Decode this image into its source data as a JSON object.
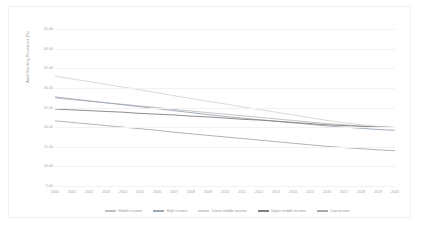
{
  "chart_data": {
    "type": "line",
    "title": "",
    "xlabel": "",
    "ylabel": "Adult Smoking Prevalence (%)",
    "ylim": [
      5,
      45
    ],
    "ytick_step": 5,
    "grid": true,
    "legend_position": "bottom",
    "x": [
      2000,
      2001,
      2002,
      2003,
      2004,
      2005,
      2006,
      2007,
      2008,
      2009,
      2010,
      2011,
      2012,
      2013,
      2014,
      2015,
      2016,
      2017,
      2018,
      2019,
      2020
    ],
    "xticklabels": [
      "2000",
      "2001",
      "2002",
      "2003",
      "2004",
      "2005",
      "2006",
      "2007",
      "2008",
      "2009",
      "2010",
      "2011",
      "2012",
      "2013",
      "2014",
      "2015",
      "2016",
      "2017",
      "2018",
      "2019",
      "2020"
    ],
    "yticklabels": [
      "5.00",
      "10.00",
      "15.00",
      "20.00",
      "25.00",
      "30.00",
      "35.00",
      "40.00",
      "45.00"
    ],
    "series": [
      {
        "name": "Middle income",
        "color": "#bfbfbf",
        "values": [
          27.4,
          27.0,
          26.6,
          26.2,
          25.8,
          25.4,
          25.0,
          24.5,
          24.1,
          23.7,
          23.3,
          22.9,
          22.5,
          22.1,
          21.7,
          21.3,
          20.9,
          20.6,
          20.3,
          20.1,
          19.9
        ]
      },
      {
        "name": "High income",
        "color": "#9aa7b4",
        "values": [
          27.7,
          27.2,
          26.7,
          26.2,
          25.7,
          25.2,
          24.7,
          24.2,
          23.7,
          23.2,
          22.7,
          22.3,
          21.9,
          21.5,
          21.1,
          20.7,
          20.3,
          20.0,
          19.7,
          19.4,
          19.2
        ]
      },
      {
        "name": "Lower middle income",
        "color": "#d6d6d6",
        "values": [
          33.0,
          32.3,
          31.6,
          30.9,
          30.2,
          29.5,
          28.8,
          28.0,
          27.3,
          26.6,
          25.9,
          25.2,
          24.5,
          23.8,
          23.1,
          22.4,
          21.7,
          21.1,
          20.6,
          20.2,
          19.9
        ]
      },
      {
        "name": "Upper middle income",
        "color": "#808080",
        "values": [
          24.6,
          24.4,
          24.2,
          24.0,
          23.8,
          23.5,
          23.3,
          23.1,
          22.8,
          22.6,
          22.3,
          22.0,
          21.8,
          21.5,
          21.2,
          20.9,
          20.6,
          20.4,
          20.2,
          20.0,
          19.9
        ]
      },
      {
        "name": "Low income",
        "color": "#a9a9a9",
        "values": [
          21.6,
          21.2,
          20.8,
          20.4,
          20.0,
          19.6,
          19.2,
          18.7,
          18.3,
          17.9,
          17.5,
          17.1,
          16.7,
          16.3,
          15.9,
          15.5,
          15.1,
          14.8,
          14.5,
          14.2,
          14.0
        ]
      }
    ]
  }
}
